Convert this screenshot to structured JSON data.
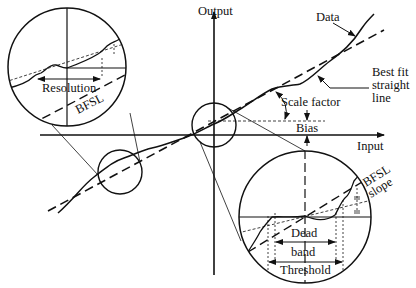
{
  "diagram": {
    "axes": {
      "x_label": "Input",
      "y_label": "Output"
    },
    "labels": {
      "data": "Data",
      "bfsl_line1": "Best fit",
      "bfsl_line2": "straight",
      "bfsl_line3": "line",
      "scale_factor": "Scale factor",
      "bias": "Bias",
      "resolution": "Resolution",
      "bfsl": "BFSL",
      "bfsl_slope_line1": "BFSL",
      "bfsl_slope_line2": "slope",
      "dead_band_line1": "Dead",
      "dead_band_line2": "band",
      "threshold": "Threshold"
    },
    "colors": {
      "ink": "#111111",
      "background": "#ffffff"
    }
  }
}
